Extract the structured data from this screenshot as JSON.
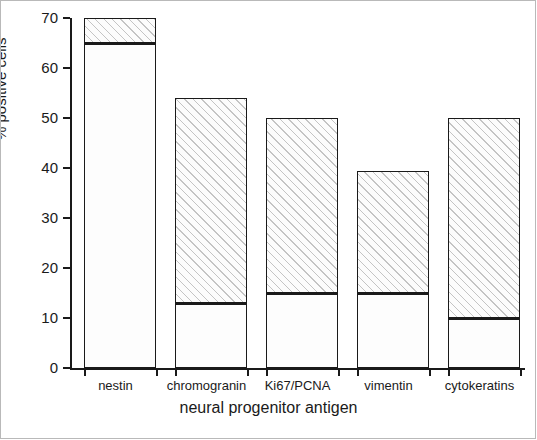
{
  "chart_data": {
    "type": "bar",
    "title": "",
    "xlabel": "neural progenitor antigen",
    "ylabel": "% positive cells",
    "ylim": [
      0,
      70
    ],
    "yticks": [
      0,
      10,
      20,
      30,
      40,
      50,
      60,
      70
    ],
    "grid": false,
    "legend": "none",
    "stacked": true,
    "categories": [
      "nestin",
      "chromogranin",
      "Ki67/PCNA",
      "vimentin",
      "cytokeratins"
    ],
    "values": [
      70,
      54,
      50,
      39.5,
      50
    ],
    "series": [
      {
        "name": "lower segment",
        "style": "plain",
        "values": [
          65,
          13,
          15,
          15,
          10
        ]
      },
      {
        "name": "upper segment",
        "style": "hatched",
        "values": [
          5,
          41,
          35,
          24.5,
          40
        ]
      }
    ],
    "segment_boundaries": [
      65,
      13,
      15,
      15,
      10
    ],
    "bar_totals": [
      70,
      54,
      50,
      39.5,
      50
    ]
  },
  "axes": {
    "y_tick_labels": [
      "0",
      "10",
      "20",
      "30",
      "40",
      "50",
      "60",
      "70"
    ],
    "y_axis_title": "% positive cells",
    "x_axis_title": "neural progenitor antigen",
    "x_tick_labels": [
      "nestin",
      "chromogranin",
      "Ki67/PCNA",
      "vimentin",
      "cytokeratins"
    ]
  },
  "colors": {
    "axis": "#1a1a1a",
    "bar_outline": "#1a1a1a",
    "bar_plain_fill": "#fdfdfd",
    "bar_hatch": "#969696",
    "background": "#ffffff"
  }
}
